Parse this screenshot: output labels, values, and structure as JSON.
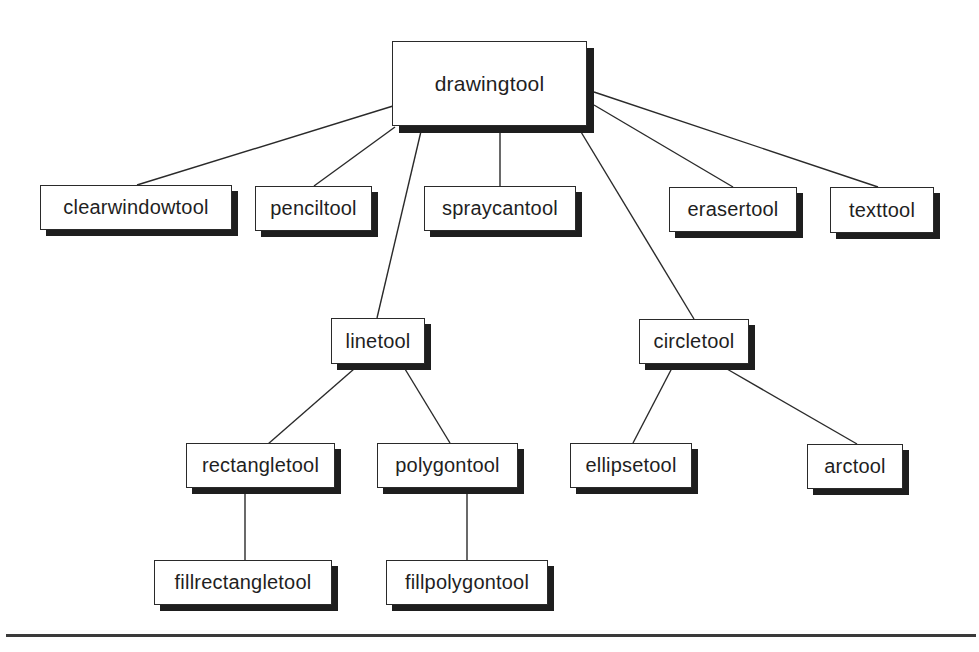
{
  "diagram": {
    "type": "tree",
    "title": "",
    "root": "drawingtool",
    "colors": {
      "box_fill": "#ffffff",
      "box_border": "#2a2a2a",
      "box_shadow": "#1e1e1e",
      "edge": "#2a2a2a",
      "text": "#1f1f1f",
      "rule": "#3a3a3a"
    },
    "nodes": {
      "drawingtool": {
        "label": "drawingtool"
      },
      "clearwindowtool": {
        "label": "clearwindowtool"
      },
      "penciltool": {
        "label": "penciltool"
      },
      "spraycantool": {
        "label": "spraycantool"
      },
      "erasertool": {
        "label": "erasertool"
      },
      "texttool": {
        "label": "texttool"
      },
      "linetool": {
        "label": "linetool"
      },
      "circletool": {
        "label": "circletool"
      },
      "rectangletool": {
        "label": "rectangletool"
      },
      "polygontool": {
        "label": "polygontool"
      },
      "ellipsetool": {
        "label": "ellipsetool"
      },
      "arctool": {
        "label": "arctool"
      },
      "fillrectangletool": {
        "label": "fillrectangletool"
      },
      "fillpolygontool": {
        "label": "fillpolygontool"
      }
    },
    "edges": [
      {
        "from": "drawingtool",
        "to": "clearwindowtool"
      },
      {
        "from": "drawingtool",
        "to": "penciltool"
      },
      {
        "from": "drawingtool",
        "to": "linetool"
      },
      {
        "from": "drawingtool",
        "to": "spraycantool"
      },
      {
        "from": "drawingtool",
        "to": "circletool"
      },
      {
        "from": "drawingtool",
        "to": "erasertool"
      },
      {
        "from": "drawingtool",
        "to": "texttool"
      },
      {
        "from": "linetool",
        "to": "rectangletool"
      },
      {
        "from": "linetool",
        "to": "polygontool"
      },
      {
        "from": "circletool",
        "to": "ellipsetool"
      },
      {
        "from": "circletool",
        "to": "arctool"
      },
      {
        "from": "rectangletool",
        "to": "fillrectangletool"
      },
      {
        "from": "polygontool",
        "to": "fillpolygontool"
      }
    ]
  }
}
